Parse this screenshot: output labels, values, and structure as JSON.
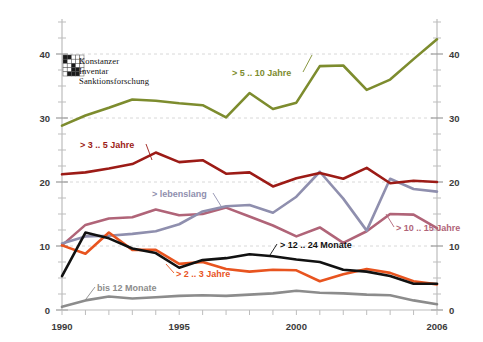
{
  "logo": {
    "name": "konstanzer-inventar-sanktionsforschung",
    "line1": "Konstanzer",
    "line2": "Inventar",
    "line3": "Sanktionsforschung"
  },
  "axes": {
    "y_ticks": [
      "0",
      "10",
      "20",
      "30",
      "40"
    ],
    "x_ticks": [
      "1990",
      "1995",
      "2000",
      "2006"
    ]
  },
  "chart_data": {
    "type": "line",
    "title": "",
    "subtitle": "",
    "xlabel": "",
    "ylabel": "",
    "xlim": [
      1990,
      2006
    ],
    "ylim": [
      0,
      45
    ],
    "grid": true,
    "legend_position": "inline-annotations",
    "x": [
      1990,
      1991,
      1992,
      1993,
      1994,
      1995,
      1996,
      1997,
      1998,
      1999,
      2000,
      2001,
      2002,
      2003,
      2004,
      2005,
      2006
    ],
    "series": [
      {
        "name": "> 5 .. 10 Jahre",
        "color": "#7d8c2e",
        "label": "> 5 .. 10 Jahre",
        "values": [
          28.8,
          30.4,
          31.6,
          32.9,
          32.7,
          32.3,
          32.0,
          30.1,
          33.9,
          31.4,
          32.4,
          38.1,
          38.2,
          34.4,
          36.0,
          39.2,
          42.3
        ]
      },
      {
        "name": "> 3 .. 5 Jahre",
        "color": "#9c1b16",
        "label": "> 3 .. 5 Jahre",
        "values": [
          21.2,
          21.5,
          22.1,
          22.8,
          24.6,
          23.1,
          23.4,
          21.3,
          21.5,
          19.3,
          20.6,
          21.4,
          20.5,
          22.2,
          19.8,
          20.2,
          20.0
        ]
      },
      {
        "name": "> lebenslang",
        "color": "#8f8fae",
        "label": "> lebenslang",
        "values": [
          10.4,
          11.5,
          11.6,
          11.9,
          12.3,
          13.4,
          15.4,
          16.2,
          16.4,
          15.2,
          17.7,
          21.6,
          17.4,
          12.4,
          20.5,
          18.9,
          18.5
        ]
      },
      {
        "name": "> 10 .. 15 Jahre",
        "color": "#b06478",
        "label": "> 10 .. 15 Jahre",
        "values": [
          10.1,
          13.3,
          14.3,
          14.5,
          15.7,
          14.8,
          15.0,
          16.0,
          14.6,
          13.2,
          11.5,
          12.9,
          10.5,
          12.3,
          15.0,
          14.9,
          12.8
        ]
      },
      {
        "name": "> 12 .. 24 Monate",
        "color": "#111111",
        "label": "> 12 .. 24 Monate",
        "values": [
          5.3,
          12.1,
          11.2,
          9.6,
          8.9,
          6.6,
          7.8,
          8.1,
          8.7,
          8.4,
          7.9,
          7.5,
          6.3,
          6.0,
          5.3,
          4.1,
          4.1
        ]
      },
      {
        "name": "> 2 .. 3 Jahre",
        "color": "#e8541f",
        "label": "> 2 .. 3 Jahre",
        "values": [
          10.1,
          8.8,
          12.1,
          9.4,
          9.4,
          7.2,
          7.5,
          6.4,
          6.0,
          6.3,
          6.2,
          4.5,
          5.6,
          6.4,
          5.8,
          4.5,
          4.0
        ]
      },
      {
        "name": "bis 12 Monate",
        "color": "#8c8c8c",
        "label": "bis  12 Monate",
        "values": [
          0.5,
          1.5,
          2.1,
          1.8,
          2.0,
          2.2,
          2.3,
          2.2,
          2.4,
          2.6,
          3.0,
          2.7,
          2.6,
          2.4,
          2.3,
          1.5,
          0.9
        ]
      }
    ]
  }
}
